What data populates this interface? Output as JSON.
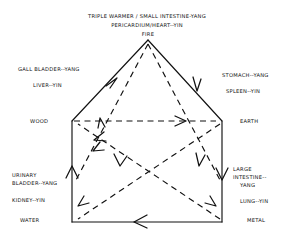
{
  "diagram": {
    "elements": {
      "fire": {
        "name": "FIRE",
        "yang_organs": "TRIPLE WARMER / SMALL INTESTINE-YANG",
        "yin_organs": "PERICARDIUM/HEART--YIN"
      },
      "wood": {
        "name": "WOOD",
        "yang_organs": "GALL BLADDER--YANG",
        "yin_organs": "LIVER--YIN"
      },
      "earth": {
        "name": "EARTH",
        "yang_organs": "STOMACH--YANG",
        "yin_organs": "SPLEEN--YIN"
      },
      "metal": {
        "name": "METAL",
        "yang_organs_line1": "LARGE",
        "yang_organs_line2": "INTESTINE--",
        "yang_organs_line3": "YANG",
        "yin_organs": "LUNG--YIN"
      },
      "water": {
        "name": "WATER",
        "yang_organs_line1": "URINARY",
        "yang_organs_line2": "BLADDER--YANG",
        "yin_organs": "KIDNEY--YIN"
      }
    },
    "colors": {
      "line": "#111111",
      "background": "#ffffff"
    },
    "cycles": {
      "generating": "solid pentagon outline with arrowheads",
      "controlling": "dashed inner star with arrowheads"
    }
  }
}
